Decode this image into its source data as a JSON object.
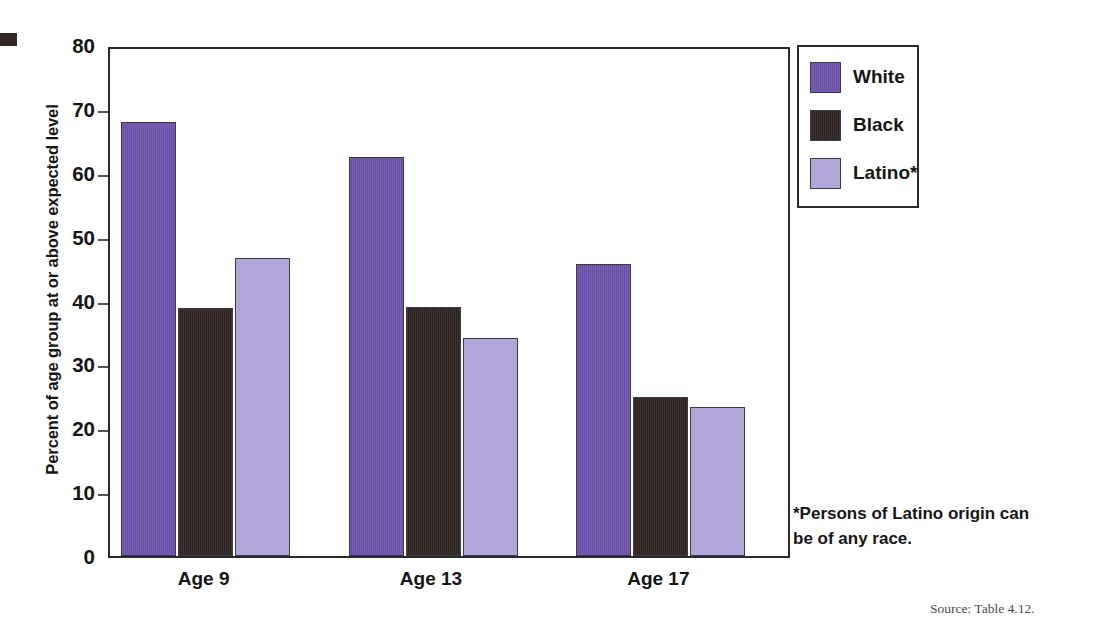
{
  "chart_data": {
    "type": "bar",
    "title": "",
    "xlabel": "",
    "ylabel": "Percent of age group at or above expected level",
    "ylim": [
      0,
      80
    ],
    "ytick_labels": [
      "80",
      "70",
      "60",
      "50",
      "40",
      "30",
      "20",
      "10",
      "0"
    ],
    "ytick_values": [
      80,
      70,
      60,
      50,
      40,
      30,
      20,
      10,
      0
    ],
    "grid": false,
    "legend_position": "right-top",
    "categories": [
      "Age 9",
      "Age 13",
      "Age 17"
    ],
    "series": [
      {
        "name": "White",
        "color": "#6b4fa8",
        "values": [
          68.0,
          62.5,
          45.7
        ]
      },
      {
        "name": "Black",
        "color": "#2b211f",
        "values": [
          38.8,
          39.0,
          24.9
        ]
      },
      {
        "name": "Latino*",
        "color": "#aea2d6",
        "values": [
          46.6,
          34.2,
          23.3
        ]
      }
    ],
    "annotations": {
      "footnote": "*Persons of Latino origin can be of any race.",
      "source": "Source: Table 4.12."
    }
  },
  "axis": {
    "y_title": "Percent of age group at or above expected level"
  },
  "legend": {
    "items": [
      {
        "label": "White"
      },
      {
        "label": "Black"
      },
      {
        "label": "Latino*"
      }
    ]
  },
  "footnote": {
    "line1": "*Persons of Latino origin can",
    "line2": "be of any race."
  },
  "source": {
    "text": "Source: Table 4.12."
  }
}
